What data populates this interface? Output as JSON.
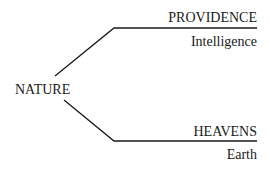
{
  "diagram": {
    "root": {
      "label": "NATURE"
    },
    "branches": [
      {
        "label": "PROVIDENCE",
        "sublabel": "Intelligence"
      },
      {
        "label": "HEAVENS",
        "sublabel": "Earth"
      }
    ],
    "colors": {
      "line": "#1a1a1a",
      "text": "#1a1a1a",
      "background": "#ffffff"
    }
  }
}
